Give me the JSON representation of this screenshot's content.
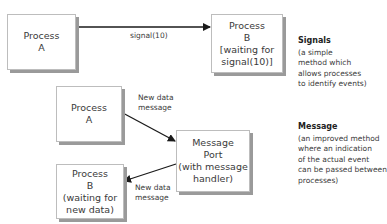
{
  "colors": {
    "line": "#1a1a1a",
    "box_border": "#bdbdbd",
    "shadow": "#9a9a9a",
    "text": "#3a3a3a"
  },
  "signals_diagram": {
    "process_a": {
      "lines": [
        "Process",
        "A"
      ]
    },
    "process_b": {
      "lines": [
        "Process",
        "B",
        "[waiting for",
        "signal(10)]"
      ]
    },
    "arrow_label": "signal(10)",
    "note": {
      "title": "Signals",
      "lines": [
        "(a simple",
        "method which",
        "allows processes",
        "to identify events)"
      ]
    }
  },
  "message_diagram": {
    "process_a": {
      "lines": [
        "Process",
        "A"
      ]
    },
    "message_port": {
      "lines": [
        "Message",
        "Port",
        "(with message",
        "handler)"
      ]
    },
    "process_b": {
      "lines": [
        "Process",
        "B",
        "(waiting for",
        "new data)"
      ]
    },
    "arrow_in_label": [
      "New data",
      "message"
    ],
    "arrow_out_label": [
      "New data",
      "message"
    ],
    "note": {
      "title": "Message",
      "lines": [
        "(an improved method",
        "where an indication",
        "of the actual event",
        "can be passed between",
        "processes)"
      ]
    }
  }
}
